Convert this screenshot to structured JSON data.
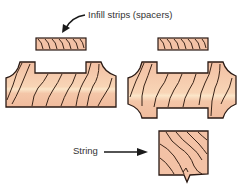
{
  "diagram": {
    "labels": {
      "infill": "Infill strips (spacers)",
      "string": "String"
    },
    "colors": {
      "wood_fill": "#f3c2a6",
      "wood_highlight": "#fbe3c8",
      "outline": "#2a1a14",
      "grain": "#3a2418",
      "text": "#333333"
    },
    "components": [
      {
        "name": "infill-strip-left"
      },
      {
        "name": "infill-strip-right"
      },
      {
        "name": "stair-piece-single-housed"
      },
      {
        "name": "stair-piece-double-housed"
      },
      {
        "name": "string-section"
      }
    ]
  }
}
